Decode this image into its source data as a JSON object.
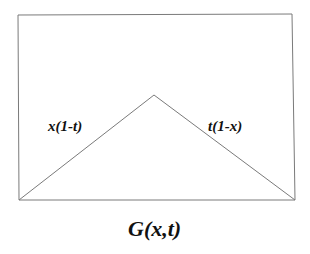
{
  "diagram": {
    "type": "geometric-figure",
    "colors": {
      "stroke": "#7a7a7a",
      "text": "#111111",
      "background": "#ffffff"
    },
    "rectangle": {
      "corners": {
        "top_left": [
          18,
          15
        ],
        "top_right": [
          292,
          14
        ],
        "bottom_left": [
          19,
          200
        ],
        "bottom_right": [
          295,
          200
        ]
      }
    },
    "triangle": {
      "left_base": [
        19,
        200
      ],
      "apex": [
        154,
        95
      ],
      "right_base": [
        295,
        200
      ]
    },
    "labels": {
      "left_edge": "x(1-t)",
      "right_edge": "t(1-x)",
      "caption": "G(x,t)"
    }
  }
}
